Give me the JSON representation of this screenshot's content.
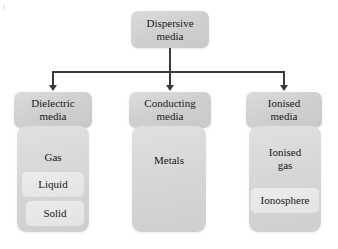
{
  "diagram": {
    "root": {
      "label": "Dispersive media",
      "line1": "Dispersive",
      "line2": "media"
    },
    "branches": [
      {
        "id": "dielectric",
        "header": "Dielectric media",
        "line1": "Dielectric",
        "line2": "media",
        "items": [
          {
            "label": "Gas",
            "style": "flat"
          },
          {
            "label": "Liquid",
            "style": "plate"
          },
          {
            "label": "Solid",
            "style": "plate"
          }
        ]
      },
      {
        "id": "conducting",
        "header": "Conducting media",
        "line1": "Conducting",
        "line2": "media",
        "items": [
          {
            "label": "Metals",
            "style": "flat"
          }
        ]
      },
      {
        "id": "ionised",
        "header": "Ionised media",
        "line1": "Ionised",
        "line2": "media",
        "items": [
          {
            "label": "Ionised gas",
            "style": "flat",
            "line1": "Ionised",
            "line2": "gas"
          },
          {
            "label": "Ionosphere",
            "style": "plate"
          }
        ]
      }
    ],
    "colors": {
      "header_fill": "#d2d2d2",
      "panel_fill": "#d9d9d9",
      "nested_fill": "#e6e6e6",
      "connector": "#3a3a3a",
      "text": "#1a1a1a",
      "background": "#ffffff"
    },
    "artifact": "l"
  }
}
